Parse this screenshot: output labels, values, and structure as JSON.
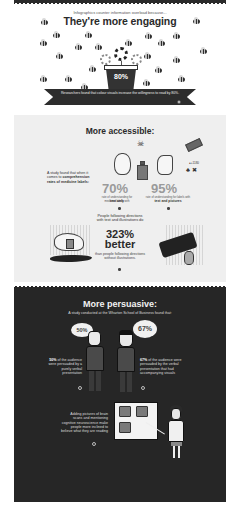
{
  "engaging": {
    "kicker": "Infographics counter information overload because...",
    "title": "They're more engaging",
    "pot_stat": "80%",
    "ribbon_text": "Researchers found that colour visuals increase the willingness to read by 80%."
  },
  "accessible": {
    "title": "More accessible:",
    "study_intro": "A study found that when it comes to",
    "study_bold": "comprehension rates of medicine labels:",
    "stat_text_only": {
      "value": "70%",
      "caption": "rate of understanding for medicine labels with",
      "caption_bold": "text only"
    },
    "stat_text_pictures": {
      "value": "95%",
      "caption": "rate of understanding for labels with",
      "caption_bold": "text and pictures"
    },
    "follow_text": "People following directions with text and illustrations do",
    "big_value": "323%",
    "big_word": "better",
    "than_text": "than people following directions without illustrations."
  },
  "persuasive": {
    "title": "More persuasive:",
    "subtitle": "A study conducted at the Wharton School of Business found that:",
    "left_bubble": "50%",
    "right_bubble": "67%",
    "left_text_bold": "50%",
    "left_text": "of the audience were persuaded by a purely verbal presentation",
    "right_text_bold": "67%",
    "right_text": "of the audience were persuaded by the verbal presentation that had accompanying visuals",
    "brain_text": "Adding pictures of brain scans and mentioning cognitive neuroscience make people more inclined to believe what they are reading"
  },
  "colors": {
    "dark_band": "#262626",
    "accessible_bg": "#efefef",
    "stat_grey": "#9a9a9a",
    "text_dark": "#2a2a2a"
  }
}
